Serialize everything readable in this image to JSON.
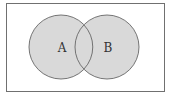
{
  "diagram": {
    "type": "venn",
    "universe": {
      "label": ""
    },
    "sets": [
      {
        "label": "A",
        "fill": "#d9d9d9",
        "stroke": "#666666"
      },
      {
        "label": "B",
        "fill": "#d9d9d9",
        "stroke": "#666666"
      }
    ],
    "colors": {
      "background": "#ffffff",
      "border": "#666666",
      "fill": "#d9d9d9"
    }
  }
}
